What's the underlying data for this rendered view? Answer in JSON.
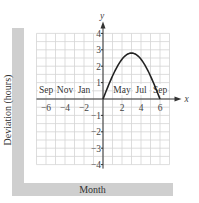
{
  "chart_data": {
    "type": "line",
    "title": "",
    "xlabel": "Month",
    "ylabel": "Deviation (hours)",
    "x_axis_name": "x",
    "y_axis_name": "y",
    "xlim": [
      -7,
      7
    ],
    "ylim": [
      -4,
      4
    ],
    "grid": true,
    "x_ticks": [
      -6,
      -4,
      -2,
      2,
      4,
      6
    ],
    "x_tick_labels": [
      "−6",
      "−4",
      "−2",
      "2",
      "4",
      "6"
    ],
    "y_ticks": [
      -4,
      -3,
      -2,
      -1,
      1,
      2,
      3,
      4
    ],
    "y_tick_labels": [
      "−4",
      "−3",
      "−2",
      "−1",
      "1",
      "2",
      "3",
      "4"
    ],
    "month_annotations": [
      {
        "label": "Sep",
        "x": -6
      },
      {
        "label": "Nov",
        "x": -4
      },
      {
        "label": "Jan",
        "x": -2
      },
      {
        "label": "May",
        "x": 2
      },
      {
        "label": "Jul",
        "x": 4
      },
      {
        "label": "Sep",
        "x": 6
      }
    ],
    "series": [
      {
        "name": "deviation",
        "x": [
          0,
          0.5,
          1,
          1.5,
          2,
          2.5,
          3,
          3.5,
          4,
          4.5,
          5,
          5.5,
          6
        ],
        "values": [
          0,
          0.72,
          1.4,
          1.98,
          2.42,
          2.7,
          2.8,
          2.7,
          2.42,
          1.98,
          1.4,
          0.72,
          0
        ]
      }
    ]
  },
  "labels": {
    "ylabel": "Deviation (hours)",
    "xlabel": "Month",
    "x_axis_name": "x",
    "y_axis_name": "y"
  }
}
